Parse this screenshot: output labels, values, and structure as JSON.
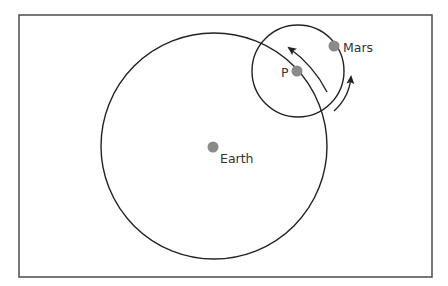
{
  "diagram": {
    "type": "orbit-epicycle",
    "frame": {
      "x": 19,
      "y": 15,
      "width": 413,
      "height": 262,
      "stroke": "#555555"
    },
    "deferent": {
      "name": "large-circle",
      "cx": 214,
      "cy": 146,
      "r": 113,
      "stroke": "#222222"
    },
    "epicycle": {
      "name": "small-circle",
      "cx": 298,
      "cy": 71,
      "r": 46,
      "stroke": "#222222"
    },
    "points": [
      {
        "id": "earth",
        "label": "Earth",
        "x": 213,
        "y": 147,
        "r": 5.5,
        "color": "#8a8a8a",
        "label_x": 220,
        "label_y": 163
      },
      {
        "id": "mars",
        "label": "Mars",
        "x": 334,
        "y": 46,
        "r": 5.5,
        "color": "#8a8a8a",
        "label_x": 343,
        "label_y": 52
      },
      {
        "id": "p",
        "label": "P",
        "x": 297,
        "y": 71,
        "r": 5.5,
        "color": "#8a8a8a",
        "label_x": 281,
        "label_y": 77
      }
    ],
    "arrows": [
      {
        "id": "deferent-motion-arrow",
        "description": "counterclockwise motion of P along the large circle",
        "path": "M 327 92 A 122 122 0 0 0 289 48"
      },
      {
        "id": "epicycle-motion-arrow",
        "description": "counterclockwise motion of Mars along the small circle",
        "path": "M 334 111 A 52 52 0 0 0 351 77"
      }
    ]
  }
}
